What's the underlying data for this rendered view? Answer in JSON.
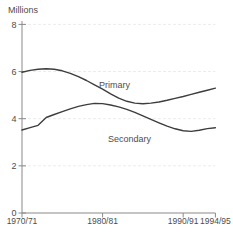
{
  "chart_data": {
    "type": "line",
    "title": "",
    "ylabel": "Millions",
    "xlabel": "",
    "ylim": [
      0,
      8
    ],
    "xlim": [
      1970,
      1994
    ],
    "grid": "faint horizontal lines at y-axis ticks",
    "legend": "inline labels next to lines",
    "x_years": [
      1970,
      1971,
      1972,
      1973,
      1974,
      1975,
      1976,
      1977,
      1978,
      1979,
      1980,
      1981,
      1982,
      1983,
      1984,
      1985,
      1986,
      1987,
      1988,
      1989,
      1990,
      1991,
      1992,
      1993,
      1994
    ],
    "series": [
      {
        "name": "Primary",
        "values": [
          5.97,
          6.05,
          6.1,
          6.12,
          6.1,
          6.03,
          5.92,
          5.78,
          5.62,
          5.44,
          5.25,
          5.05,
          4.87,
          4.74,
          4.66,
          4.63,
          4.66,
          4.71,
          4.78,
          4.86,
          4.94,
          5.03,
          5.12,
          5.21,
          5.3
        ],
        "label_x": 99,
        "label_y": 88
      },
      {
        "name": "Secondary",
        "values": [
          3.52,
          3.62,
          3.72,
          4.05,
          4.18,
          4.3,
          4.42,
          4.52,
          4.6,
          4.65,
          4.64,
          4.58,
          4.5,
          4.4,
          4.27,
          4.12,
          3.97,
          3.82,
          3.68,
          3.57,
          3.49,
          3.46,
          3.51,
          3.58,
          3.62
        ],
        "label_x": 108,
        "label_y": 142
      }
    ],
    "yticks": [
      8,
      6,
      4,
      2,
      0
    ],
    "xticks": [
      {
        "label": "1970/71",
        "year": 1970,
        "tick": false
      },
      {
        "label": "1980/81",
        "year": 1980,
        "tick": true
      },
      {
        "label": "1990/91",
        "year": 1990,
        "tick": true
      },
      {
        "label": "1994/95",
        "year": 1994,
        "tick": true
      }
    ],
    "colors": {
      "line": "#3d3d3d",
      "axis": "#898989",
      "text": "#4d4d4d",
      "grid": "#ececec",
      "background": "#ffffff"
    }
  }
}
